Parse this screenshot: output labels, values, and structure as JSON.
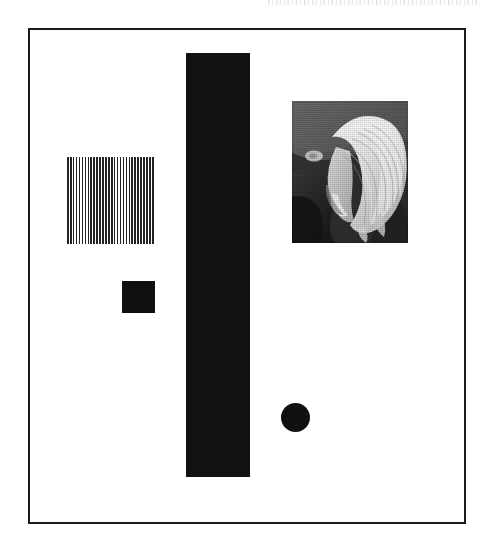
{
  "artwork": {
    "medium": "black-and-white scanned page",
    "background_color": "#ffffff",
    "ink_color": "#111111",
    "frame": {
      "label": "plate border",
      "border_color": "#1b1b1b",
      "border_width_px": 2,
      "x": 28,
      "y": 28,
      "width": 438,
      "height": 496
    },
    "elements": [
      {
        "id": "striped-square",
        "label": "striped square",
        "shape": "square",
        "fill": "vertical black and white stripes",
        "stripe_color": "#232323",
        "gap_color": "#ffffff",
        "stripe_count": 30,
        "x": 67,
        "y": 157,
        "width": 88,
        "height": 87
      },
      {
        "id": "black-square",
        "label": "small solid black square",
        "shape": "square",
        "fill": "#101010",
        "x": 122,
        "y": 281,
        "width": 33,
        "height": 32
      },
      {
        "id": "tall-bar",
        "label": "tall vertical black bar",
        "shape": "rectangle",
        "fill": "#111111",
        "x": 186,
        "y": 53,
        "width": 64,
        "height": 424
      },
      {
        "id": "black-circle",
        "label": "solid black circle",
        "shape": "circle",
        "fill": "#101010",
        "x": 281,
        "y": 403,
        "width": 29,
        "height": 29
      },
      {
        "id": "photograph",
        "label": "black and white photograph of a person with light hair seen in profile",
        "shape": "rectangle",
        "fill": "grayscale halftone photograph",
        "x": 292,
        "y": 101,
        "width": 116,
        "height": 142,
        "subject": "head with long light blonde hair, face turned down and to the left, dark clothing and dark background"
      },
      {
        "id": "scan-artifact",
        "label": "faint scanner speckle band at top edge",
        "shape": "band",
        "fill": "light gray speckle",
        "x": 268,
        "y": 0,
        "width": 210,
        "height": 5
      }
    ]
  }
}
